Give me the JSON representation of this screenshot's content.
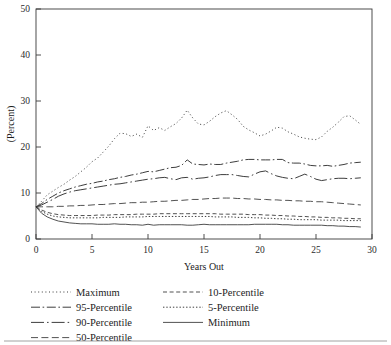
{
  "chart_data": {
    "type": "line",
    "title": "",
    "xlabel": "Years Out",
    "ylabel": "(Percent)",
    "xlim": [
      0,
      30
    ],
    "ylim": [
      0,
      50
    ],
    "xticks": [
      0,
      5,
      10,
      15,
      20,
      25,
      30
    ],
    "yticks": [
      0,
      10,
      20,
      30,
      40,
      50
    ],
    "xtick_labels": [
      "0",
      "5",
      "10",
      "15",
      "20",
      "25",
      "30"
    ],
    "ytick_labels": [
      "0",
      "10",
      "20",
      "30",
      "40",
      "50"
    ],
    "grid": false,
    "legend_position": "below-axes",
    "x": [
      0,
      0.5,
      1,
      1.5,
      2,
      2.5,
      3,
      3.5,
      4,
      4.5,
      5,
      5.5,
      6,
      6.5,
      7,
      7.5,
      8,
      8.5,
      9,
      9.5,
      10,
      10.5,
      11,
      11.5,
      12,
      12.5,
      13,
      13.5,
      14,
      14.5,
      15,
      15.5,
      16,
      16.5,
      17,
      17.5,
      18,
      18.5,
      19,
      19.5,
      20,
      20.5,
      21,
      21.5,
      22,
      22.5,
      23,
      23.5,
      24,
      24.5,
      25,
      25.5,
      26,
      26.5,
      27,
      27.5,
      28,
      28.5,
      29
    ],
    "series": [
      {
        "name": "Maximum",
        "style": "dotted",
        "values": [
          7.0,
          8.2,
          9.6,
          10.4,
          11.2,
          11.9,
          12.8,
          13.6,
          14.6,
          15.6,
          16.8,
          17.6,
          18.9,
          20.2,
          21.8,
          23.0,
          22.9,
          22.3,
          22.8,
          22.1,
          24.6,
          23.6,
          24.2,
          23.6,
          24.4,
          25.1,
          26.3,
          28.0,
          26.3,
          25.0,
          24.8,
          25.6,
          26.6,
          27.4,
          27.9,
          27.0,
          26.0,
          24.5,
          23.7,
          23.1,
          22.4,
          22.8,
          23.5,
          24.3,
          24.1,
          23.3,
          22.8,
          22.2,
          21.9,
          21.7,
          21.6,
          22.2,
          23.4,
          24.3,
          25.4,
          26.6,
          26.8,
          25.9,
          24.9
        ]
      },
      {
        "name": "95-Percentile",
        "style": "dash-dot",
        "values": [
          7.0,
          7.7,
          8.6,
          9.3,
          10.0,
          10.5,
          10.9,
          11.3,
          11.6,
          11.9,
          12.1,
          12.4,
          12.6,
          12.9,
          13.1,
          13.4,
          13.6,
          13.9,
          14.1,
          14.4,
          14.7,
          14.6,
          14.9,
          15.2,
          15.5,
          15.6,
          16.0,
          17.2,
          16.3,
          16.2,
          16.1,
          16.3,
          16.2,
          16.2,
          16.5,
          16.7,
          16.9,
          17.2,
          17.3,
          17.3,
          17.2,
          17.2,
          17.2,
          17.3,
          17.3,
          16.6,
          16.5,
          16.5,
          16.3,
          16.0,
          15.9,
          15.9,
          16.0,
          15.8,
          16.0,
          16.2,
          16.5,
          16.6,
          16.7
        ]
      },
      {
        "name": "90-Percentile",
        "style": "long-dash-dot",
        "values": [
          7.0,
          7.4,
          8.0,
          8.6,
          9.3,
          9.8,
          10.2,
          10.5,
          10.7,
          10.9,
          11.1,
          11.3,
          11.5,
          11.7,
          11.9,
          12.0,
          12.2,
          12.4,
          12.6,
          12.8,
          13.0,
          13.1,
          13.3,
          13.4,
          13.1,
          12.9,
          13.3,
          13.4,
          13.0,
          13.2,
          13.3,
          13.5,
          13.8,
          14.0,
          14.0,
          14.0,
          13.8,
          13.6,
          13.5,
          14.1,
          14.6,
          14.8,
          14.2,
          13.7,
          13.4,
          13.2,
          13.1,
          13.6,
          14.1,
          13.6,
          13.0,
          12.7,
          12.9,
          13.1,
          13.2,
          13.2,
          13.1,
          13.2,
          13.3
        ]
      },
      {
        "name": "50-Percentile",
        "style": "dashed",
        "values": [
          7.0,
          7.0,
          7.0,
          7.0,
          7.1,
          7.1,
          7.2,
          7.2,
          7.3,
          7.3,
          7.4,
          7.5,
          7.5,
          7.6,
          7.7,
          7.7,
          7.8,
          7.9,
          7.9,
          8.0,
          8.0,
          8.1,
          8.2,
          8.2,
          8.3,
          8.4,
          8.4,
          8.5,
          8.6,
          8.6,
          8.7,
          8.8,
          8.8,
          8.9,
          8.9,
          8.9,
          8.8,
          8.8,
          8.7,
          8.7,
          8.6,
          8.6,
          8.5,
          8.5,
          8.4,
          8.4,
          8.3,
          8.3,
          8.2,
          8.2,
          8.1,
          8.1,
          8.0,
          7.9,
          7.8,
          7.7,
          7.6,
          7.5,
          7.4
        ]
      },
      {
        "name": "10-Percentile",
        "style": "short-dash",
        "values": [
          7.0,
          6.3,
          5.8,
          5.5,
          5.3,
          5.2,
          5.1,
          5.1,
          5.1,
          5.1,
          5.1,
          5.2,
          5.2,
          5.2,
          5.3,
          5.3,
          5.3,
          5.3,
          5.4,
          5.4,
          5.4,
          5.4,
          5.5,
          5.5,
          5.5,
          5.5,
          5.5,
          5.5,
          5.5,
          5.5,
          5.5,
          5.5,
          5.5,
          5.4,
          5.4,
          5.4,
          5.4,
          5.4,
          5.3,
          5.3,
          5.3,
          5.2,
          5.2,
          5.1,
          5.1,
          5.0,
          5.0,
          4.9,
          4.9,
          4.8,
          4.8,
          4.7,
          4.7,
          4.6,
          4.6,
          4.5,
          4.5,
          4.4,
          4.4
        ]
      },
      {
        "name": "5-Percentile",
        "style": "fine-dotted",
        "values": [
          7.0,
          6.0,
          5.4,
          5.0,
          4.8,
          4.7,
          4.6,
          4.6,
          4.6,
          4.6,
          4.6,
          4.6,
          4.7,
          4.7,
          4.7,
          4.7,
          4.8,
          4.8,
          4.8,
          4.8,
          4.9,
          4.9,
          4.9,
          4.9,
          4.9,
          4.9,
          4.9,
          4.9,
          4.9,
          4.9,
          4.9,
          4.9,
          4.8,
          4.8,
          4.8,
          4.8,
          4.7,
          4.7,
          4.7,
          4.6,
          4.6,
          4.5,
          4.5,
          4.4,
          4.4,
          4.3,
          4.3,
          4.2,
          4.2,
          4.2,
          4.2,
          4.1,
          4.1,
          4.1,
          4.1,
          4.0,
          4.0,
          4.0,
          4.0
        ]
      },
      {
        "name": "Minimum",
        "style": "solid",
        "values": [
          7.0,
          5.6,
          4.8,
          4.3,
          3.9,
          3.7,
          3.5,
          3.4,
          3.3,
          3.3,
          3.3,
          3.2,
          3.2,
          3.2,
          3.3,
          3.2,
          3.2,
          3.1,
          3.1,
          3.0,
          3.2,
          3.0,
          3.1,
          3.1,
          3.1,
          3.1,
          3.1,
          3.0,
          3.0,
          3.1,
          3.2,
          3.1,
          3.1,
          3.1,
          3.1,
          3.1,
          3.1,
          3.1,
          3.1,
          3.2,
          3.2,
          3.2,
          3.2,
          3.2,
          3.1,
          3.1,
          3.0,
          3.0,
          3.0,
          3.0,
          3.0,
          3.0,
          2.9,
          2.9,
          2.8,
          2.8,
          2.7,
          2.7,
          2.6
        ]
      }
    ]
  },
  "legend": {
    "column_left": [
      {
        "label": "Maximum",
        "style": "dotted"
      },
      {
        "label": "95-Percentile",
        "style": "dash-dot"
      },
      {
        "label": "90-Percentile",
        "style": "long-dash-dot"
      },
      {
        "label": "50-Percentile",
        "style": "dashed"
      }
    ],
    "column_right": [
      {
        "label": "10-Percentile",
        "style": "short-dash"
      },
      {
        "label": "5-Percentile",
        "style": "fine-dotted"
      },
      {
        "label": "Minimum",
        "style": "solid"
      }
    ]
  },
  "colors": {
    "line": "#333333",
    "axis": "#3a3a3a",
    "text": "#1d1d1d",
    "background": "#ffffff"
  }
}
